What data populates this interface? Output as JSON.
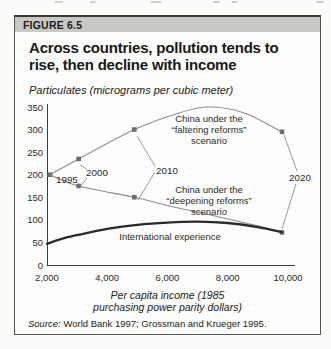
{
  "figure": {
    "label": "FIGURE 6.5",
    "title_lines": [
      "Across countries, pollution tends to",
      "rise, then decline with income"
    ],
    "subtitle": "Particulates (micrograms per cubic meter)",
    "source_prefix": "Source:",
    "source_text": "World Bank 1997; Grossman and Krueger 1995."
  },
  "chart_data": {
    "type": "line",
    "value_label": "Particulates (micrograms per cubic meter)",
    "xlabel": "Per capita income (1985 purchasing power parity dollars)",
    "xlabel_lines": [
      "Per capita income (1985",
      "purchasing power parity dollars)"
    ],
    "xlim": [
      2000,
      10000
    ],
    "ylim": [
      0,
      350
    ],
    "grid": false,
    "legend": "inline labels",
    "x_ticks": [
      "2,000",
      "4,000",
      "6,000",
      "8,000",
      "10,000"
    ],
    "x_tick_values": [
      2000,
      4000,
      6000,
      8000,
      10000
    ],
    "y_ticks": [
      0,
      50,
      100,
      150,
      200,
      250,
      300,
      350
    ],
    "series": [
      {
        "name": "China under the “faltering reforms” scenario",
        "color": "#8d8d8d",
        "width": 1.1,
        "points": [
          [
            2100,
            200
          ],
          [
            3050,
            235
          ],
          [
            4900,
            300
          ],
          [
            6200,
            333
          ],
          [
            7300,
            350
          ],
          [
            8500,
            338
          ],
          [
            9800,
            295
          ]
        ],
        "markers": [
          [
            2100,
            200
          ],
          [
            3050,
            235
          ],
          [
            4900,
            300
          ],
          [
            9800,
            295
          ]
        ]
      },
      {
        "name": "China under the “deepening reforms” scenario",
        "color": "#8d8d8d",
        "width": 1.1,
        "points": [
          [
            2100,
            200
          ],
          [
            3050,
            175
          ],
          [
            4900,
            150
          ],
          [
            6000,
            132
          ],
          [
            7000,
            117
          ],
          [
            8000,
            102
          ],
          [
            9000,
            87
          ],
          [
            9800,
            72
          ]
        ],
        "markers": [
          [
            3050,
            175
          ],
          [
            4900,
            150
          ],
          [
            9800,
            72
          ]
        ]
      },
      {
        "name": "International experience",
        "color": "#2a2a2a",
        "width": 2.3,
        "points": [
          [
            2000,
            47
          ],
          [
            2600,
            60
          ],
          [
            3200,
            69
          ],
          [
            4000,
            80
          ],
          [
            5000,
            89
          ],
          [
            6000,
            94
          ],
          [
            7000,
            96
          ],
          [
            8000,
            93
          ],
          [
            9000,
            84
          ],
          [
            9800,
            73
          ]
        ],
        "markers": []
      }
    ],
    "year_annotations": [
      {
        "label": "1995",
        "income": 2100,
        "faltering": 200,
        "deepening": 200
      },
      {
        "label": "2000",
        "income": 3050,
        "faltering": 235,
        "deepening": 175
      },
      {
        "label": "2010",
        "income": 4900,
        "faltering": 300,
        "deepening": 150
      },
      {
        "label": "2020",
        "income": 9800,
        "faltering": 295,
        "deepening": 72
      }
    ],
    "inline_labels": {
      "faltering": [
        "China under the",
        "“faltering reforms”",
        "scenario"
      ],
      "deepening": [
        "China under the",
        "“deepening reforms”",
        "scenario"
      ],
      "international": "International experience"
    }
  }
}
